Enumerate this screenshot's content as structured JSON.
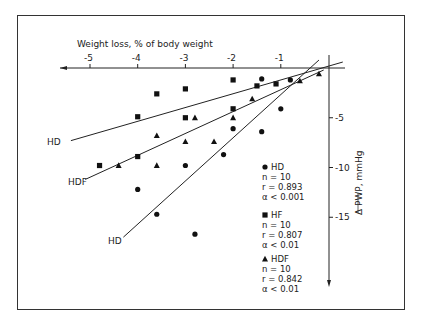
{
  "chart_data": {
    "type": "scatter",
    "title": "",
    "xlabel": "Weight loss, % of body weight",
    "ylabel": "Δ PWP, mmHg",
    "x_ticks": [
      "-5",
      "-4",
      "-3",
      "-2",
      "-1"
    ],
    "y_ticks": [
      "-5",
      "-10",
      "-15"
    ],
    "xlim": [
      -5.5,
      0.3
    ],
    "ylim": [
      -22,
      0.8
    ],
    "grid": false,
    "legend_position": "right-inside",
    "series": [
      {
        "name": "HD",
        "marker": "circle",
        "n": "n = 10",
        "r": "r = 0.893",
        "alpha": "α < 0.001",
        "x": [
          -4.0,
          -3.6,
          -2.8,
          -3.0,
          -2.0,
          -2.2,
          -1.4,
          -1.4,
          -1.0,
          -0.8
        ],
        "y": [
          -12.2,
          -14.7,
          -16.7,
          -9.8,
          -6.1,
          -8.7,
          -6.4,
          -1.1,
          -4.1,
          -1.2
        ],
        "regression_line": {
          "label": "HD",
          "from": [
            -4.3,
            -17.0
          ],
          "to": [
            -0.2,
            0.8
          ]
        }
      },
      {
        "name": "HF",
        "marker": "square",
        "n": "n = 10",
        "r": "r = 0.807",
        "alpha": "α < 0.01",
        "x": [
          -4.8,
          -4.0,
          -4.0,
          -3.6,
          -3.0,
          -3.0,
          -2.0,
          -2.0,
          -1.5,
          -1.1
        ],
        "y": [
          -9.8,
          -8.9,
          -4.9,
          -2.6,
          -2.1,
          -5.0,
          -1.2,
          -4.1,
          -1.8,
          -1.6
        ],
        "regression_line": {
          "label": "HD",
          "from": [
            -5.4,
            -7.3
          ],
          "to": [
            0.3,
            0.6
          ]
        }
      },
      {
        "name": "HDF",
        "marker": "triangle",
        "n": "n = 10",
        "r": "r = 0.842",
        "alpha": "α < 0.01",
        "x": [
          -4.4,
          -3.6,
          -3.6,
          -3.0,
          -2.8,
          -2.4,
          -2.0,
          -1.6,
          -0.6,
          -0.2
        ],
        "y": [
          -9.8,
          -9.8,
          -6.8,
          -7.4,
          -5.0,
          -7.4,
          -5.0,
          -3.1,
          -1.3,
          -0.6
        ],
        "regression_line": {
          "label": "HDF",
          "from": [
            -5.1,
            -11.2
          ],
          "to": [
            -0.1,
            -0.2
          ]
        }
      }
    ],
    "line_labels": [
      "HD",
      "HDF",
      "HD"
    ]
  }
}
